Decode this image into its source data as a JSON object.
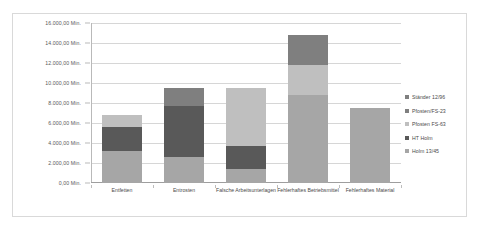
{
  "chart_data": {
    "type": "bar",
    "stacked": true,
    "title": "",
    "xlabel": "",
    "ylabel": "",
    "ylim": [
      0,
      16000
    ],
    "ytick_step": 2000,
    "ytick_labels": [
      "0,00 Min.",
      "2.000,00 Min.",
      "4.000,00 Min.",
      "6.000,00 Min.",
      "8.000,00 Min.",
      "10.000,00 Min.",
      "12.000,00 Min.",
      "14.000,00 Min.",
      "16.000,00 Min."
    ],
    "ytick_values": [
      0,
      2000,
      4000,
      6000,
      8000,
      10000,
      12000,
      14000,
      16000
    ],
    "grid": true,
    "legend_position": "right",
    "categories": [
      "Entfetten",
      "Entrosten",
      "Falsche Arbeitsunterlagen",
      "Fehlerhaftes Betriebsmittel",
      "Fehlerhaftes Material"
    ],
    "series": [
      {
        "name": "Holm 13/45",
        "color": "#a6a6a6",
        "values": [
          3200,
          2600,
          1400,
          8800,
          7500
        ]
      },
      {
        "name": "HT Holm",
        "color": "#595959",
        "values": [
          2400,
          5100,
          2300,
          0,
          0
        ]
      },
      {
        "name": "Pfosten FS-63",
        "color": "#bfbfbf",
        "values": [
          1200,
          0,
          5800,
          3000,
          0
        ]
      },
      {
        "name": "Pfosten/FS-23",
        "color": "#7f7f7f",
        "values": [
          0,
          1800,
          0,
          3000,
          0
        ]
      },
      {
        "name": "Ständer 12/96",
        "color": "#808080",
        "values": [
          0,
          0,
          0,
          0,
          0
        ]
      }
    ],
    "totals": [
      6800,
      9500,
      9500,
      14800,
      7500
    ]
  },
  "legend": {
    "items": [
      {
        "label": "Ständer 12/96",
        "color": "#808080"
      },
      {
        "label": "Pfosten/FS-23",
        "color": "#7f7f7f"
      },
      {
        "label": "Pfosten FS-63",
        "color": "#bfbfbf"
      },
      {
        "label": "HT Holm",
        "color": "#595959"
      },
      {
        "label": "Holm 13/45",
        "color": "#a6a6a6"
      }
    ]
  },
  "style": {
    "plot_background": "#ffffff",
    "grid_color": "#d6d6d6",
    "frame_border": "#d9d9d9",
    "axis_color": "#b9b9b9",
    "text_color": "#4a4a4a"
  }
}
